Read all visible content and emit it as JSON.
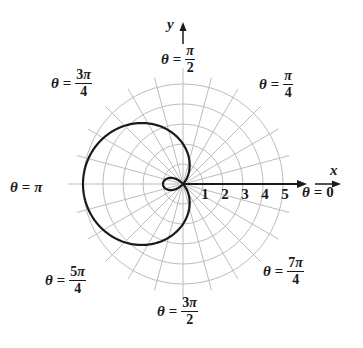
{
  "chart_data": {
    "type": "polar",
    "equation": "r = 2 - 3cos(theta)",
    "curve": "limacon with inner loop",
    "pole": {
      "x": 183,
      "y": 184
    },
    "unit_px": 20,
    "grid": {
      "circles": [
        1,
        2,
        3,
        4,
        5
      ],
      "ray_step_deg": 15,
      "ray_extent": 5.5
    },
    "radial_ticks": [
      "1",
      "2",
      "3",
      "4",
      "5"
    ],
    "axis_labels": {
      "x": "x",
      "y": "y"
    },
    "angle_labels": [
      {
        "id": "pi_over_2",
        "theta": "θ",
        "eq": "=",
        "num": "π",
        "den": "2",
        "x": 161,
        "y": 61
      },
      {
        "id": "3pi_over_4",
        "theta": "θ",
        "eq": "=",
        "num": "3π",
        "den": "4",
        "x": 51,
        "y": 85
      },
      {
        "id": "pi_over_4",
        "theta": "θ",
        "eq": "=",
        "num": "π",
        "den": "4",
        "x": 259,
        "y": 86
      },
      {
        "id": "pi",
        "theta": "θ",
        "eq": "=",
        "num": "π",
        "den": "",
        "x": 10,
        "y": 188
      },
      {
        "id": "zero",
        "theta": "θ",
        "eq": "=",
        "num": "0",
        "den": "",
        "x": 302,
        "y": 193
      },
      {
        "id": "5pi_over_4",
        "theta": "θ",
        "eq": "=",
        "num": "5π",
        "den": "4",
        "x": 45,
        "y": 282
      },
      {
        "id": "3pi_over_2",
        "theta": "θ",
        "eq": "=",
        "num": "3π",
        "den": "2",
        "x": 157,
        "y": 313
      },
      {
        "id": "7pi_over_4",
        "theta": "θ",
        "eq": "=",
        "num": "7π",
        "den": "4",
        "x": 263,
        "y": 273
      }
    ],
    "colors": {
      "curve": "#1a1a1a",
      "axis": "#1a1a1a",
      "grid": "#bdbdbd",
      "background": "#ffffff"
    }
  }
}
